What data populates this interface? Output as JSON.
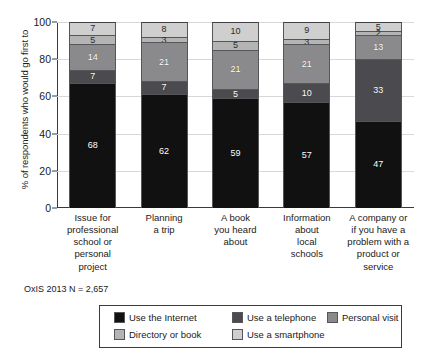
{
  "chart_data": {
    "type": "bar",
    "stacked": true,
    "title": "",
    "xlabel": "",
    "ylabel": "% of respondents who would go first to",
    "ylim": [
      0,
      100
    ],
    "yticks": [
      0,
      20,
      40,
      60,
      80,
      100
    ],
    "grid": true,
    "legend_position": "bottom",
    "categories": [
      "Issue for professional school or personal project",
      "Planning a trip",
      "A book you heard about",
      "Information about local schools",
      "A company or if you have a problem with a product or service"
    ],
    "series": [
      {
        "name": "Use the Internet",
        "color": "#111111",
        "values": [
          68,
          62,
          59,
          57,
          47
        ]
      },
      {
        "name": "Use a telephone",
        "color": "#4a4a4f",
        "values": [
          7,
          7,
          5,
          10,
          33
        ]
      },
      {
        "name": "Personal visit",
        "color": "#8a8a8c",
        "values": [
          14,
          21,
          21,
          21,
          13
        ]
      },
      {
        "name": "Directory or book",
        "color": "#b4b4b4",
        "values": [
          5,
          3,
          5,
          3,
          2
        ]
      },
      {
        "name": "Use a smartphone",
        "color": "#cfcfcf",
        "values": [
          7,
          8,
          10,
          9,
          5
        ]
      }
    ],
    "annotation": "OxIS 2013 N = 2,657"
  },
  "axis": {
    "y_title": "% of respondents who would go first to",
    "y_tick_labels": [
      "100",
      "80",
      "60",
      "40",
      "20",
      "0"
    ]
  },
  "categories": [
    {
      "lines": [
        "Issue for",
        "professional",
        "school or",
        "personal project"
      ]
    },
    {
      "lines": [
        "Planning",
        "a trip"
      ]
    },
    {
      "lines": [
        "A book",
        "you heard",
        "about"
      ]
    },
    {
      "lines": [
        "Information",
        "about",
        "local",
        "schools"
      ]
    },
    {
      "lines": [
        "A company or",
        "if you have a",
        "problem with a",
        "product or",
        "service"
      ]
    }
  ],
  "bars": [
    {
      "name": "bar-issue-professional",
      "segments": [
        {
          "label": "7",
          "value": 7,
          "series": "Use a smartphone",
          "color": "#cfcfcf",
          "light": true
        },
        {
          "label": "5",
          "value": 5,
          "series": "Directory or book",
          "color": "#b4b4b4",
          "light": true
        },
        {
          "label": "14",
          "value": 14,
          "series": "Personal visit",
          "color": "#8a8a8c",
          "light": false
        },
        {
          "label": "7",
          "value": 7,
          "series": "Use a telephone",
          "color": "#4a4a4f",
          "light": false
        },
        {
          "label": "68",
          "value": 68,
          "series": "Use the Internet",
          "color": "#111111",
          "light": false
        }
      ]
    },
    {
      "name": "bar-planning-trip",
      "segments": [
        {
          "label": "8",
          "value": 8,
          "series": "Use a smartphone",
          "color": "#cfcfcf",
          "light": true
        },
        {
          "label": "3",
          "value": 3,
          "series": "Directory or book",
          "color": "#b4b4b4",
          "light": true
        },
        {
          "label": "21",
          "value": 21,
          "series": "Personal visit",
          "color": "#8a8a8c",
          "light": false
        },
        {
          "label": "7",
          "value": 7,
          "series": "Use a telephone",
          "color": "#4a4a4f",
          "light": false
        },
        {
          "label": "62",
          "value": 62,
          "series": "Use the Internet",
          "color": "#111111",
          "light": false
        }
      ]
    },
    {
      "name": "bar-book-heard-about",
      "segments": [
        {
          "label": "10",
          "value": 10,
          "series": "Use a smartphone",
          "color": "#cfcfcf",
          "light": true
        },
        {
          "label": "5",
          "value": 5,
          "series": "Directory or book",
          "color": "#b4b4b4",
          "light": true
        },
        {
          "label": "21",
          "value": 21,
          "series": "Personal visit",
          "color": "#8a8a8c",
          "light": false
        },
        {
          "label": "5",
          "value": 5,
          "series": "Use a telephone",
          "color": "#4a4a4f",
          "light": false
        },
        {
          "label": "59",
          "value": 59,
          "series": "Use the Internet",
          "color": "#111111",
          "light": false
        }
      ]
    },
    {
      "name": "bar-local-schools",
      "segments": [
        {
          "label": "9",
          "value": 9,
          "series": "Use a smartphone",
          "color": "#cfcfcf",
          "light": true
        },
        {
          "label": "3",
          "value": 3,
          "series": "Directory or book",
          "color": "#b4b4b4",
          "light": true
        },
        {
          "label": "21",
          "value": 21,
          "series": "Personal visit",
          "color": "#8a8a8c",
          "light": false
        },
        {
          "label": "10",
          "value": 10,
          "series": "Use a telephone",
          "color": "#4a4a4f",
          "light": false
        },
        {
          "label": "57",
          "value": 57,
          "series": "Use the Internet",
          "color": "#111111",
          "light": false
        }
      ]
    },
    {
      "name": "bar-company-problem",
      "segments": [
        {
          "label": "5",
          "value": 5,
          "series": "Use a smartphone",
          "color": "#cfcfcf",
          "light": true
        },
        {
          "label": "2",
          "value": 2,
          "series": "Directory or book",
          "color": "#b4b4b4",
          "light": true
        },
        {
          "label": "13",
          "value": 13,
          "series": "Personal visit",
          "color": "#8a8a8c",
          "light": false
        },
        {
          "label": "33",
          "value": 33,
          "series": "Use a telephone",
          "color": "#4a4a4f",
          "light": false
        },
        {
          "label": "47",
          "value": 47,
          "series": "Use the Internet",
          "color": "#111111",
          "light": false
        }
      ]
    }
  ],
  "source_note": "OxIS 2013 N = 2,657",
  "legend": {
    "rows": [
      [
        {
          "label": "Use the Internet",
          "color": "#111111"
        },
        {
          "label": "Use a telephone",
          "color": "#4a4a4f"
        },
        {
          "label": "Personal visit",
          "color": "#8a8a8c"
        }
      ],
      [
        {
          "label": "Directory or book",
          "color": "#b4b4b4"
        },
        {
          "label": "Use a smartphone",
          "color": "#cfcfcf"
        }
      ]
    ]
  }
}
